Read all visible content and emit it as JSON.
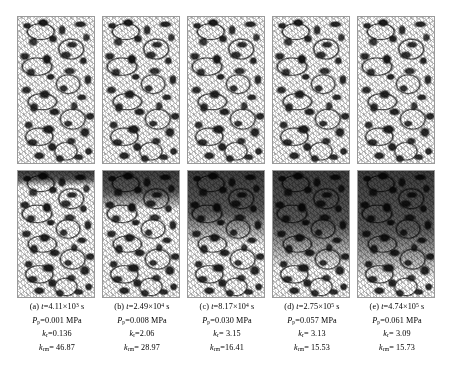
{
  "figure": {
    "type": "scientific-image-series",
    "rows": 2,
    "columns": 5,
    "row_labels": [
      "top-row-pore-structure",
      "bottom-row-saturation"
    ]
  },
  "panels": [
    {
      "id": "a",
      "label": "(a)",
      "time_label": "t",
      "time_mantissa": "4.11",
      "time_exponent": "3",
      "time_unit": "s",
      "pressure_label": "P",
      "pressure_sub": "p",
      "pressure_value": "=0.001 MPa",
      "kr_label": "k",
      "kr_sub": "r",
      "kr_value": "=0.136",
      "krm_label": "k",
      "krm_sub": "rm",
      "krm_value": "= 46.87",
      "invasion_percent": 12
    },
    {
      "id": "b",
      "label": "(b)",
      "time_label": "t",
      "time_mantissa": "2.49",
      "time_exponent": "4",
      "time_unit": "s",
      "pressure_label": "P",
      "pressure_sub": "p",
      "pressure_value": "=0.008 MPa",
      "kr_label": "k",
      "kr_sub": "r",
      "kr_value": "=2.06",
      "krm_label": "k",
      "krm_sub": "rm",
      "krm_value": "= 28.97",
      "invasion_percent": 30
    },
    {
      "id": "c",
      "label": "(c)",
      "time_label": "t",
      "time_mantissa": "8.17",
      "time_exponent": "4",
      "time_unit": "s",
      "pressure_label": "P",
      "pressure_sub": "p",
      "pressure_value": "=0.030 MPa",
      "kr_label": "k",
      "kr_sub": "r",
      "kr_value": "= 3.15",
      "krm_label": "k",
      "krm_sub": "rm",
      "krm_value": "=16.41",
      "invasion_percent": 58
    },
    {
      "id": "d",
      "label": "(d)",
      "time_label": "t",
      "time_mantissa": "2.75",
      "time_exponent": "5",
      "time_unit": "s",
      "pressure_label": "P",
      "pressure_sub": "p",
      "pressure_value": "=0.057 MPa",
      "kr_label": "k",
      "kr_sub": "r",
      "kr_value": "= 3.13",
      "krm_label": "k",
      "krm_sub": "rm",
      "krm_value": "= 15.53",
      "invasion_percent": 76
    },
    {
      "id": "e",
      "label": "(e)",
      "time_label": "t",
      "time_mantissa": "4.74",
      "time_exponent": "5",
      "time_unit": "s",
      "pressure_label": "P",
      "pressure_sub": "p",
      "pressure_value": "=0.061 MPa",
      "kr_label": "k",
      "kr_sub": "r",
      "kr_value": "= 3.09",
      "krm_label": "k",
      "krm_sub": "rm",
      "krm_value": "= 15.73",
      "invasion_percent": 84
    }
  ],
  "symbols": {
    "times": "×",
    "equals": "="
  },
  "chart_data": {
    "type": "table",
    "title": "",
    "xlabel": "",
    "ylabel": "",
    "categories": [
      "(a)",
      "(b)",
      "(c)",
      "(d)",
      "(e)"
    ],
    "series": [
      {
        "name": "t (s)",
        "values": [
          4110,
          24900,
          81700,
          275000,
          474000
        ]
      },
      {
        "name": "Pp (MPa)",
        "values": [
          0.001,
          0.008,
          0.03,
          0.057,
          0.061
        ]
      },
      {
        "name": "kr",
        "values": [
          0.136,
          2.06,
          3.15,
          3.13,
          3.09
        ]
      },
      {
        "name": "krm",
        "values": [
          46.87,
          28.97,
          16.41,
          15.53,
          15.73
        ]
      }
    ]
  },
  "colors": {
    "frame": "#9a9a9a",
    "grain": "#2b2b2b",
    "background": "#ffffff"
  }
}
